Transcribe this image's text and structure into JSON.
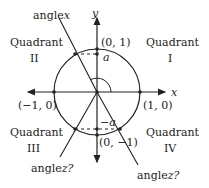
{
  "diagram": {
    "axes": {
      "x_label": "x",
      "y_label": "y"
    },
    "quadrants": [
      {
        "name": "Quadrant",
        "numeral": "I"
      },
      {
        "name": "Quadrant",
        "numeral": "II"
      },
      {
        "name": "Quadrant",
        "numeral": "III"
      },
      {
        "name": "Quadrant",
        "numeral": "IV"
      }
    ],
    "points": {
      "top": "(0, 1)",
      "left": "(−1, 0)",
      "right": "(1, 0)",
      "bottom": "(0, −1)"
    },
    "markers": {
      "a": "a",
      "neg_a": "−a"
    },
    "angle_labels": {
      "angle_x_word": "angle",
      "angle_x_var": "x",
      "angle_z_left_word": "angle",
      "angle_z_left_var": "z?",
      "angle_z_right_word": "angle",
      "angle_z_right_var": "z?"
    },
    "colors": {
      "stroke": "#222222",
      "background": "#ffffff"
    }
  }
}
